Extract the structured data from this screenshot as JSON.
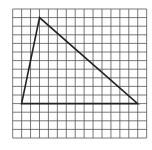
{
  "diagram": {
    "type": "grid-triangle",
    "grid": {
      "columns": 15,
      "rows": 15,
      "origin_x": 12.7,
      "origin_y": 9,
      "cell_w": 8.93,
      "cell_h": 8.6,
      "line_color": "#555555"
    },
    "triangle": {
      "vertices": [
        {
          "col": 3,
          "row": 1
        },
        {
          "col": 1,
          "row": 11
        },
        {
          "col": 14,
          "row": 11
        }
      ],
      "stroke_color": "#222222",
      "stroke_width": 1.6
    }
  }
}
